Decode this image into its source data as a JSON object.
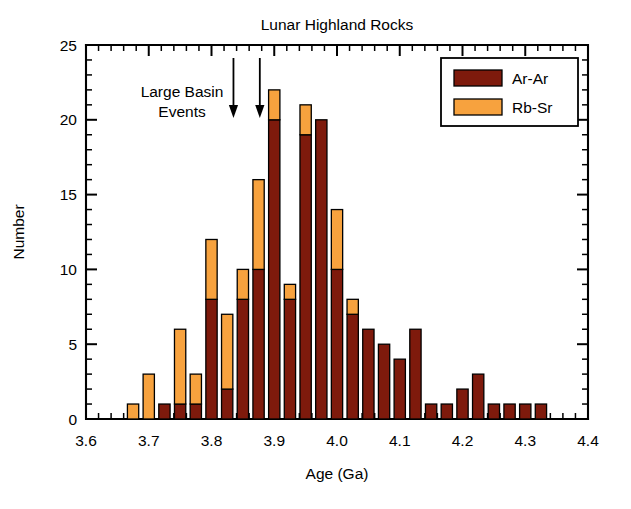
{
  "chart_data": {
    "type": "bar",
    "title": "Lunar Highland Rocks",
    "xlabel": "Age (Ga)",
    "ylabel": "Number",
    "xlim": [
      3.6,
      4.4
    ],
    "ylim": [
      0,
      25
    ],
    "xticks": [
      "3.6",
      "3.7",
      "3.8",
      "3.9",
      "4.0",
      "4.1",
      "4.2",
      "4.3",
      "4.4"
    ],
    "xtick_values": [
      3.6,
      3.7,
      3.8,
      3.9,
      4.0,
      4.1,
      4.2,
      4.3,
      4.4
    ],
    "yticks": [
      "0",
      "5",
      "10",
      "15",
      "20",
      "25"
    ],
    "ytick_values": [
      0,
      5,
      10,
      15,
      20,
      25
    ],
    "x_minor_step": 0.02,
    "y_minor_step": 1,
    "grid": false,
    "stacked": true,
    "bin_width": 0.025,
    "legend_position": "top-right",
    "categories": [
      3.675,
      3.7,
      3.725,
      3.75,
      3.775,
      3.8,
      3.825,
      3.85,
      3.875,
      3.9,
      3.925,
      3.95,
      3.975,
      4.0,
      4.025,
      4.05,
      4.075,
      4.1,
      4.125,
      4.15,
      4.175,
      4.2,
      4.225,
      4.25,
      4.275,
      4.3,
      4.325
    ],
    "series": [
      {
        "name": "Ar-Ar",
        "color": "#7E1A0C",
        "values": [
          0,
          0,
          1,
          1,
          1,
          8,
          2,
          8,
          10,
          20,
          8,
          19,
          20,
          10,
          7,
          6,
          5,
          4,
          6,
          1,
          1,
          2,
          3,
          1,
          1,
          1,
          1
        ]
      },
      {
        "name": "Rb-Sr",
        "color": "#F7A23E",
        "values": [
          1,
          3,
          0,
          5,
          2,
          4,
          5,
          2,
          6,
          2,
          1,
          2,
          0,
          4,
          1,
          0,
          0,
          0,
          0,
          0,
          0,
          0,
          0,
          0,
          0,
          0,
          0
        ]
      }
    ],
    "totals": [
      1,
      3,
      1,
      6,
      3,
      12,
      7,
      10,
      16,
      22,
      9,
      21,
      20,
      14,
      8,
      6,
      5,
      4,
      6,
      1,
      1,
      2,
      3,
      1,
      1,
      1,
      1
    ],
    "annotations": [
      {
        "text_line1": "Large Basin",
        "text_line2": "Events",
        "arrow_x_values": [
          3.835,
          3.877
        ]
      }
    ]
  },
  "legend": {
    "entries": [
      {
        "label": "Ar-Ar",
        "color": "#7E1A0C"
      },
      {
        "label": "Rb-Sr",
        "color": "#F7A23E"
      }
    ]
  },
  "colors": {
    "ar_ar": "#7E1A0C",
    "rb_sr": "#F7A23E",
    "axis": "#000000",
    "background": "#FFFFFF"
  }
}
